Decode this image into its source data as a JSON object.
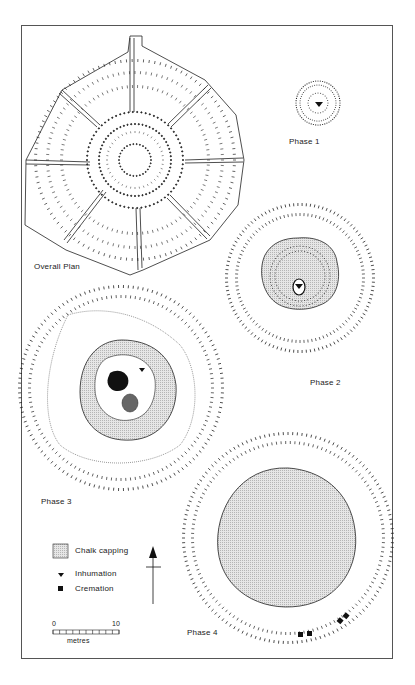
{
  "figure": {
    "panels": [
      {
        "id": "overall",
        "label": "Overall Plan"
      },
      {
        "id": "phase1",
        "label": "Phase 1"
      },
      {
        "id": "phase2",
        "label": "Phase 2"
      },
      {
        "id": "phase3",
        "label": "Phase 3"
      },
      {
        "id": "phase4",
        "label": "Phase 4"
      }
    ],
    "legend": {
      "items": [
        {
          "symbol": "stippled-square",
          "label": "Chalk capping"
        },
        {
          "symbol": "inverted-triangle",
          "label": "Inhumation"
        },
        {
          "symbol": "filled-square",
          "label": "Cremation"
        }
      ]
    },
    "north_arrow": "north-arrow",
    "scale_bar": {
      "start": "0",
      "end": "10",
      "unit": "metres"
    },
    "colors": {
      "ink": "#222222",
      "capping_fill": "#d4d4d4",
      "frame": "#555555"
    }
  }
}
